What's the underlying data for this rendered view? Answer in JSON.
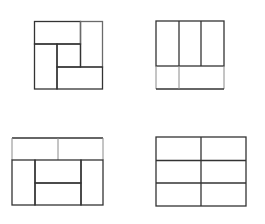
{
  "diagram": {
    "stroke_color": "#333333",
    "light_stroke_color": "#8a8a8a",
    "background": "#ffffff",
    "figures": [
      {
        "id": "pinwheel",
        "label": "",
        "position": "top-left",
        "outer": [
          34,
          21,
          103,
          89
        ]
      },
      {
        "id": "three-columns-two-cells",
        "label": "",
        "position": "top-right",
        "outer": [
          156,
          21,
          224,
          89
        ]
      },
      {
        "id": "brick-layout",
        "label": "",
        "position": "bottom-left",
        "outer": [
          12,
          138,
          103,
          205
        ]
      },
      {
        "id": "grid-2x3",
        "label": "",
        "position": "bottom-right",
        "outer": [
          156,
          137,
          246,
          206
        ]
      }
    ]
  }
}
